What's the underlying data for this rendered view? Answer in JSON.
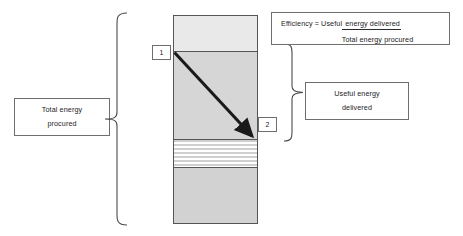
{
  "diagram": {
    "labels": {
      "total_energy": {
        "line1": "Total energy",
        "line2": "procured"
      },
      "useful_energy": {
        "line1": "Useful energy",
        "line2": "delivered"
      }
    },
    "formula": {
      "prefix": "Efficiency = Useful",
      "numerator": " energy delivered",
      "denominator": "Total energy procured"
    },
    "markers": [
      {
        "id": "1",
        "label": "1"
      },
      {
        "id": "2",
        "label": "2"
      }
    ],
    "bands": [
      {
        "name": "top-band",
        "fill": "#e9e9e9",
        "pattern": "solid"
      },
      {
        "name": "middle-band",
        "fill": "#d6d6d6",
        "pattern": "solid"
      },
      {
        "name": "striped-band",
        "fill": "#cfcfcf",
        "pattern": "horizontal-stripes"
      },
      {
        "name": "bottom-band",
        "fill": "#d2d2d2",
        "pattern": "solid"
      }
    ],
    "colors": {
      "outline": "#555555",
      "box_border": "#6e6e6e",
      "arrow": "#1a1a1a",
      "background": "#ffffff",
      "text": "#1c1c1c"
    }
  }
}
